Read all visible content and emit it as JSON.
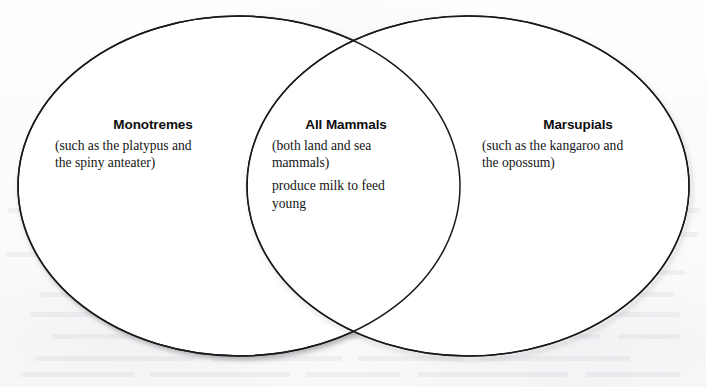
{
  "diagram": {
    "type": "venn",
    "title": "",
    "stroke_color": "#1a1a1a",
    "fill_color": "#ffffff",
    "background_color": "#fdfdfd",
    "sets": [
      {
        "id": "left",
        "region": "left-only",
        "heading": "Monotremes",
        "lines": [
          "(such as the platypus and",
          "the spiny anteater)"
        ]
      },
      {
        "id": "center",
        "region": "intersection",
        "heading": "All Mammals",
        "lines": [
          "(both land and sea",
          "mammals)",
          "produce milk to feed",
          "young"
        ]
      },
      {
        "id": "right",
        "region": "right-only",
        "heading": "Marsupials",
        "lines": [
          "(such as the kangaroo and",
          "the opossum)"
        ]
      }
    ]
  }
}
